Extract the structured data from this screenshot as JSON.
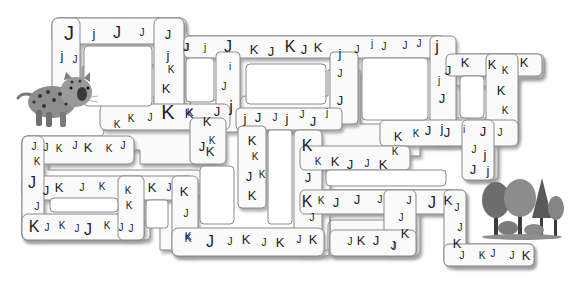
{
  "puzzle": {
    "type": "letter-maze",
    "start_character": "jaguar",
    "goal": "forest",
    "letters_used": [
      "J",
      "j",
      "K"
    ]
  },
  "colors": {
    "path_fill": "#fafafa",
    "path_edge": "#8a8a8a",
    "shadow": "#c8c8c8",
    "text": "#222222"
  },
  "letters": [
    {
      "ch": "J",
      "x": 69,
      "y": 33,
      "s": 4
    },
    {
      "ch": "j",
      "x": 94,
      "y": 33,
      "s": 2
    },
    {
      "ch": "J",
      "x": 117,
      "y": 33,
      "s": 3
    },
    {
      "ch": "J",
      "x": 142,
      "y": 33,
      "s": 1
    },
    {
      "ch": "J",
      "x": 168,
      "y": 34,
      "s": 2
    },
    {
      "ch": "j",
      "x": 62,
      "y": 55,
      "s": 2
    },
    {
      "ch": "J",
      "x": 75,
      "y": 60,
      "s": 1
    },
    {
      "ch": "J",
      "x": 186,
      "y": 48,
      "s": 1
    },
    {
      "ch": "j",
      "x": 168,
      "y": 55,
      "s": 2
    },
    {
      "ch": "K",
      "x": 171,
      "y": 70,
      "s": 1
    },
    {
      "ch": "K",
      "x": 166,
      "y": 88,
      "s": 2
    },
    {
      "ch": "K",
      "x": 168,
      "y": 112,
      "s": 4
    },
    {
      "ch": "K",
      "x": 190,
      "y": 113,
      "s": 1
    },
    {
      "ch": "J",
      "x": 187,
      "y": 48,
      "s": 1
    },
    {
      "ch": "j",
      "x": 205,
      "y": 48,
      "s": 1
    },
    {
      "ch": "J",
      "x": 228,
      "y": 47,
      "s": 3
    },
    {
      "ch": "K",
      "x": 254,
      "y": 49,
      "s": 2
    },
    {
      "ch": "J",
      "x": 271,
      "y": 51,
      "s": 2
    },
    {
      "ch": "K",
      "x": 290,
      "y": 47,
      "s": 3
    },
    {
      "ch": "J",
      "x": 304,
      "y": 49,
      "s": 2
    },
    {
      "ch": "K",
      "x": 318,
      "y": 47,
      "s": 2
    },
    {
      "ch": "j",
      "x": 340,
      "y": 53,
      "s": 2
    },
    {
      "ch": "J",
      "x": 357,
      "y": 50,
      "s": 1
    },
    {
      "ch": "j",
      "x": 372,
      "y": 44,
      "s": 1
    },
    {
      "ch": "J",
      "x": 384,
      "y": 47,
      "s": 1
    },
    {
      "ch": "J",
      "x": 405,
      "y": 46,
      "s": 1
    },
    {
      "ch": "J",
      "x": 419,
      "y": 44,
      "s": 1
    },
    {
      "ch": "j",
      "x": 437,
      "y": 47,
      "s": 3
    },
    {
      "ch": "i",
      "x": 230,
      "y": 67,
      "s": 1
    },
    {
      "ch": "J",
      "x": 224,
      "y": 87,
      "s": 1
    },
    {
      "ch": "j",
      "x": 231,
      "y": 107,
      "s": 3
    },
    {
      "ch": "K",
      "x": 189,
      "y": 113,
      "s": 2
    },
    {
      "ch": "K",
      "x": 207,
      "y": 121,
      "s": 2
    },
    {
      "ch": "J",
      "x": 217,
      "y": 111,
      "s": 2
    },
    {
      "ch": "J",
      "x": 340,
      "y": 74,
      "s": 1
    },
    {
      "ch": "J",
      "x": 340,
      "y": 100,
      "s": 2
    },
    {
      "ch": "j",
      "x": 245,
      "y": 118,
      "s": 2
    },
    {
      "ch": "J",
      "x": 258,
      "y": 117,
      "s": 2
    },
    {
      "ch": "J",
      "x": 275,
      "y": 118,
      "s": 1
    },
    {
      "ch": "j",
      "x": 287,
      "y": 118,
      "s": 2
    },
    {
      "ch": "J",
      "x": 302,
      "y": 115,
      "s": 1
    },
    {
      "ch": "J",
      "x": 313,
      "y": 121,
      "s": 2
    },
    {
      "ch": "j",
      "x": 327,
      "y": 113,
      "s": 1
    },
    {
      "ch": "J",
      "x": 448,
      "y": 70,
      "s": 2
    },
    {
      "ch": "j",
      "x": 439,
      "y": 81,
      "s": 1
    },
    {
      "ch": "J",
      "x": 442,
      "y": 98,
      "s": 2
    },
    {
      "ch": "K",
      "x": 465,
      "y": 62,
      "s": 2
    },
    {
      "ch": "K",
      "x": 492,
      "y": 64,
      "s": 2
    },
    {
      "ch": "K",
      "x": 505,
      "y": 71,
      "s": 1
    },
    {
      "ch": "K",
      "x": 524,
      "y": 62,
      "s": 2
    },
    {
      "ch": "K",
      "x": 501,
      "y": 90,
      "s": 2
    },
    {
      "ch": "K",
      "x": 505,
      "y": 111,
      "s": 1
    },
    {
      "ch": "K",
      "x": 398,
      "y": 136,
      "s": 2
    },
    {
      "ch": "K",
      "x": 416,
      "y": 134,
      "s": 1
    },
    {
      "ch": "J",
      "x": 428,
      "y": 130,
      "s": 2
    },
    {
      "ch": "j",
      "x": 442,
      "y": 128,
      "s": 2
    },
    {
      "ch": "J",
      "x": 447,
      "y": 132,
      "s": 2
    },
    {
      "ch": "i",
      "x": 464,
      "y": 130,
      "s": 1
    },
    {
      "ch": "J",
      "x": 483,
      "y": 131,
      "s": 2
    },
    {
      "ch": "J",
      "x": 500,
      "y": 133,
      "s": 1
    },
    {
      "ch": "J",
      "x": 474,
      "y": 150,
      "s": 1
    },
    {
      "ch": "j",
      "x": 485,
      "y": 154,
      "s": 2
    },
    {
      "ch": "J",
      "x": 473,
      "y": 169,
      "s": 2
    },
    {
      "ch": "j",
      "x": 488,
      "y": 170,
      "s": 2
    },
    {
      "ch": "K",
      "x": 117,
      "y": 125,
      "s": 1
    },
    {
      "ch": "K",
      "x": 131,
      "y": 119,
      "s": 1
    },
    {
      "ch": "J",
      "x": 150,
      "y": 118,
      "s": 1
    },
    {
      "ch": "J",
      "x": 34,
      "y": 147,
      "s": 1
    },
    {
      "ch": "J",
      "x": 46,
      "y": 148,
      "s": 1
    },
    {
      "ch": "K",
      "x": 59,
      "y": 149,
      "s": 1
    },
    {
      "ch": "J",
      "x": 75,
      "y": 146,
      "s": 1
    },
    {
      "ch": "K",
      "x": 88,
      "y": 147,
      "s": 2
    },
    {
      "ch": "K",
      "x": 109,
      "y": 149,
      "s": 1
    },
    {
      "ch": "J",
      "x": 123,
      "y": 146,
      "s": 1
    },
    {
      "ch": "K",
      "x": 37,
      "y": 162,
      "s": 1
    },
    {
      "ch": "K",
      "x": 212,
      "y": 141,
      "s": 1
    },
    {
      "ch": "J",
      "x": 202,
      "y": 146,
      "s": 2
    },
    {
      "ch": "K",
      "x": 210,
      "y": 151,
      "s": 2
    },
    {
      "ch": "K",
      "x": 252,
      "y": 140,
      "s": 2
    },
    {
      "ch": "K",
      "x": 255,
      "y": 157,
      "s": 1
    },
    {
      "ch": "J",
      "x": 249,
      "y": 176,
      "s": 2
    },
    {
      "ch": "K",
      "x": 262,
      "y": 175,
      "s": 1
    },
    {
      "ch": "K",
      "x": 252,
      "y": 195,
      "s": 2
    },
    {
      "ch": "K",
      "x": 307,
      "y": 146,
      "s": 3
    },
    {
      "ch": "K",
      "x": 318,
      "y": 162,
      "s": 1
    },
    {
      "ch": "K",
      "x": 335,
      "y": 161,
      "s": 2
    },
    {
      "ch": "J",
      "x": 350,
      "y": 164,
      "s": 2
    },
    {
      "ch": "J",
      "x": 367,
      "y": 164,
      "s": 1
    },
    {
      "ch": "K",
      "x": 383,
      "y": 164,
      "s": 2
    },
    {
      "ch": "K",
      "x": 395,
      "y": 152,
      "s": 1
    },
    {
      "ch": "J",
      "x": 308,
      "y": 177,
      "s": 2
    },
    {
      "ch": "J",
      "x": 32,
      "y": 183,
      "s": 3
    },
    {
      "ch": "J",
      "x": 46,
      "y": 190,
      "s": 2
    },
    {
      "ch": "K",
      "x": 59,
      "y": 187,
      "s": 2
    },
    {
      "ch": "J",
      "x": 82,
      "y": 188,
      "s": 1
    },
    {
      "ch": "K",
      "x": 102,
      "y": 187,
      "s": 1
    },
    {
      "ch": "K",
      "x": 128,
      "y": 191,
      "s": 1
    },
    {
      "ch": "K",
      "x": 152,
      "y": 187,
      "s": 2
    },
    {
      "ch": "J",
      "x": 169,
      "y": 188,
      "s": 1
    },
    {
      "ch": "K",
      "x": 184,
      "y": 191,
      "s": 2
    },
    {
      "ch": "J",
      "x": 37,
      "y": 207,
      "s": 1
    },
    {
      "ch": "K",
      "x": 129,
      "y": 206,
      "s": 1
    },
    {
      "ch": "J",
      "x": 186,
      "y": 214,
      "s": 1
    },
    {
      "ch": "K",
      "x": 188,
      "y": 237,
      "s": 1
    },
    {
      "ch": "K",
      "x": 34,
      "y": 227,
      "s": 3
    },
    {
      "ch": "J",
      "x": 47,
      "y": 228,
      "s": 1
    },
    {
      "ch": "K",
      "x": 62,
      "y": 226,
      "s": 1
    },
    {
      "ch": "J",
      "x": 77,
      "y": 229,
      "s": 1
    },
    {
      "ch": "J",
      "x": 88,
      "y": 230,
      "s": 3
    },
    {
      "ch": "K",
      "x": 107,
      "y": 226,
      "s": 1
    },
    {
      "ch": "J",
      "x": 121,
      "y": 228,
      "s": 1
    },
    {
      "ch": "J",
      "x": 131,
      "y": 229,
      "s": 1
    },
    {
      "ch": "K",
      "x": 307,
      "y": 202,
      "s": 3
    },
    {
      "ch": "K",
      "x": 321,
      "y": 201,
      "s": 1
    },
    {
      "ch": "J",
      "x": 336,
      "y": 202,
      "s": 2
    },
    {
      "ch": "J",
      "x": 357,
      "y": 199,
      "s": 2
    },
    {
      "ch": "J",
      "x": 380,
      "y": 200,
      "s": 1
    },
    {
      "ch": "J",
      "x": 409,
      "y": 201,
      "s": 1
    },
    {
      "ch": "J",
      "x": 432,
      "y": 203,
      "s": 3
    },
    {
      "ch": "K",
      "x": 448,
      "y": 200,
      "s": 2
    },
    {
      "ch": "J",
      "x": 457,
      "y": 208,
      "s": 1
    },
    {
      "ch": "J",
      "x": 312,
      "y": 218,
      "s": 1
    },
    {
      "ch": "J",
      "x": 401,
      "y": 218,
      "s": 1
    },
    {
      "ch": "K",
      "x": 405,
      "y": 233,
      "s": 2
    },
    {
      "ch": "J",
      "x": 394,
      "y": 247,
      "s": 1
    },
    {
      "ch": "K",
      "x": 188,
      "y": 239,
      "s": 1
    },
    {
      "ch": "J",
      "x": 210,
      "y": 242,
      "s": 3
    },
    {
      "ch": "J",
      "x": 230,
      "y": 242,
      "s": 1
    },
    {
      "ch": "K",
      "x": 246,
      "y": 239,
      "s": 2
    },
    {
      "ch": "J",
      "x": 264,
      "y": 243,
      "s": 1
    },
    {
      "ch": "K",
      "x": 280,
      "y": 242,
      "s": 2
    },
    {
      "ch": "J",
      "x": 299,
      "y": 240,
      "s": 1
    },
    {
      "ch": "K",
      "x": 313,
      "y": 239,
      "s": 2
    },
    {
      "ch": "J",
      "x": 350,
      "y": 242,
      "s": 1
    },
    {
      "ch": "K",
      "x": 361,
      "y": 240,
      "s": 2
    },
    {
      "ch": "J",
      "x": 376,
      "y": 240,
      "s": 2
    },
    {
      "ch": "J",
      "x": 393,
      "y": 246,
      "s": 1
    },
    {
      "ch": "J",
      "x": 460,
      "y": 228,
      "s": 1
    },
    {
      "ch": "K",
      "x": 457,
      "y": 243,
      "s": 2
    },
    {
      "ch": "J",
      "x": 462,
      "y": 256,
      "s": 1
    },
    {
      "ch": "K",
      "x": 482,
      "y": 256,
      "s": 1
    },
    {
      "ch": "J",
      "x": 493,
      "y": 254,
      "s": 1
    },
    {
      "ch": "J",
      "x": 512,
      "y": 256,
      "s": 1
    },
    {
      "ch": "K",
      "x": 526,
      "y": 255,
      "s": 2
    }
  ]
}
